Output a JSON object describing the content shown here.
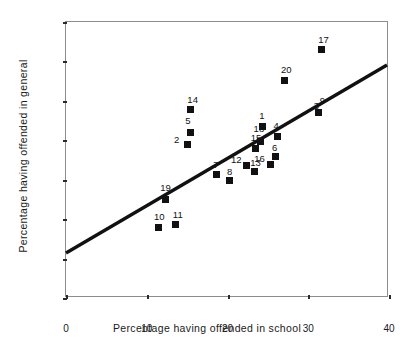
{
  "chart_data": {
    "type": "scatter",
    "title": "",
    "xlabel": "Percentage having offended in school",
    "ylabel": "Percentage having offended in general",
    "xlim": [
      0,
      40
    ],
    "ylim": [
      0,
      70
    ],
    "xticks": [
      0,
      10,
      20,
      30,
      40
    ],
    "yticks": [
      0,
      10,
      20,
      30,
      40,
      50,
      60,
      70
    ],
    "grid": false,
    "legend": "none",
    "marker": "filled-square",
    "marker_color": "#111111",
    "points": [
      {
        "label": "1",
        "x": 24.3,
        "y": 43.5
      },
      {
        "label": "2",
        "x": 15.1,
        "y": 39.0
      },
      {
        "label": "3",
        "x": 31.3,
        "y": 47.0
      },
      {
        "label": "4",
        "x": 26.2,
        "y": 41.0
      },
      {
        "label": "5",
        "x": 15.4,
        "y": 41.9
      },
      {
        "label": "6",
        "x": 26.0,
        "y": 35.8
      },
      {
        "label": "7",
        "x": 18.6,
        "y": 31.2
      },
      {
        "label": "8",
        "x": 20.3,
        "y": 29.8
      },
      {
        "label": "9",
        "x": 31.3,
        "y": 47.0
      },
      {
        "label": "10",
        "x": 11.4,
        "y": 18.0
      },
      {
        "label": "11",
        "x": 13.6,
        "y": 18.6
      },
      {
        "label": "12",
        "x": 22.4,
        "y": 33.6
      },
      {
        "label": "13",
        "x": 23.3,
        "y": 32.2
      },
      {
        "label": "14",
        "x": 15.4,
        "y": 47.7
      },
      {
        "label": "15",
        "x": 23.5,
        "y": 38.0
      },
      {
        "label": "16",
        "x": 25.3,
        "y": 33.8
      },
      {
        "label": "17",
        "x": 31.6,
        "y": 63.0
      },
      {
        "label": "18",
        "x": 24.1,
        "y": 39.8
      },
      {
        "label": "19",
        "x": 12.3,
        "y": 25.0
      },
      {
        "label": "20",
        "x": 27.0,
        "y": 55.2
      }
    ],
    "trendline": {
      "x0": 0,
      "y0": 11.0,
      "x1": 40,
      "y1": 59.0,
      "color": "#111111"
    }
  }
}
